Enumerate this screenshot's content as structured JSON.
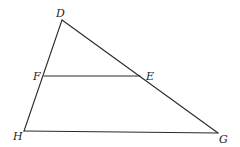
{
  "diagram": {
    "type": "triangle-with-parallel-segment",
    "points": {
      "D": {
        "label": "D",
        "x": 62,
        "y": 20,
        "lx": 56,
        "ly": 17
      },
      "F": {
        "label": "F",
        "x": 44,
        "y": 76,
        "lx": 33,
        "ly": 80
      },
      "E": {
        "label": "E",
        "x": 140,
        "y": 76,
        "lx": 146,
        "ly": 80
      },
      "H": {
        "label": "H",
        "x": 24,
        "y": 131,
        "lx": 13,
        "ly": 140
      },
      "G": {
        "label": "G",
        "x": 218,
        "y": 133,
        "lx": 219,
        "ly": 143
      }
    },
    "segments": [
      {
        "name": "DH",
        "from": "D",
        "to": "H"
      },
      {
        "name": "DG",
        "from": "D",
        "to": "G"
      },
      {
        "name": "HG",
        "from": "H",
        "to": "G"
      },
      {
        "name": "FE",
        "from": "F",
        "to": "E"
      }
    ],
    "line_color": "#2a2a2a"
  }
}
